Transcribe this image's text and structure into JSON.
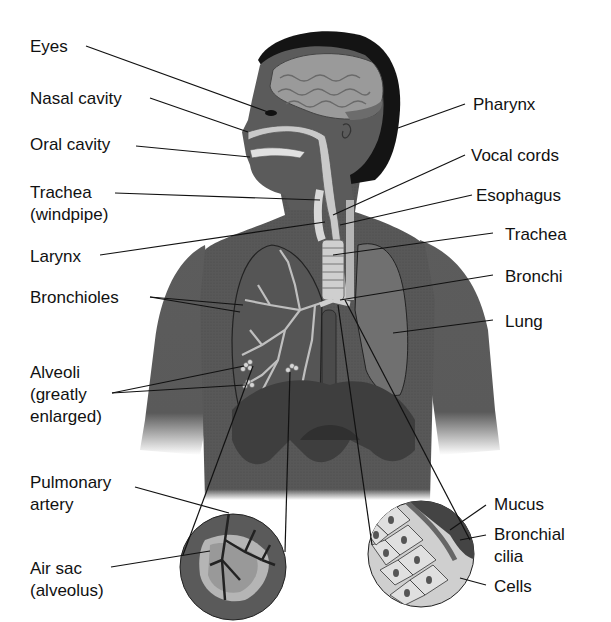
{
  "diagram": {
    "colors": {
      "background": "#ffffff",
      "skin": "#5a5a5a",
      "skin_dark": "#474747",
      "hair": "#111111",
      "brain": "#9a9a9a",
      "airway": "#c8c8c8",
      "lung": "#6e6e6e",
      "diaphragm": "#3f3f3f",
      "text": "#111111"
    },
    "labels_left": {
      "eyes": "Eyes",
      "nasal_cavity": "Nasal cavity",
      "oral_cavity": "Oral cavity",
      "trachea_windpipe_1": "Trachea",
      "trachea_windpipe_2": "(windpipe)",
      "larynx": "Larynx",
      "bronchioles": "Bronchioles",
      "alveoli_1": "Alveoli",
      "alveoli_2": "(greatly",
      "alveoli_3": "enlarged)",
      "pulmonary_artery_1": "Pulmonary",
      "pulmonary_artery_2": "artery",
      "air_sac_1": "Air sac",
      "air_sac_2": "(alveolus)"
    },
    "labels_right": {
      "pharynx": "Pharynx",
      "vocal_cords": "Vocal cords",
      "esophagus": "Esophagus",
      "trachea": "Trachea",
      "bronchi": "Bronchi",
      "lung": "Lung",
      "mucus": "Mucus",
      "bronchial_cilia_1": "Bronchial",
      "bronchial_cilia_2": "cilia",
      "cells": "Cells"
    }
  }
}
